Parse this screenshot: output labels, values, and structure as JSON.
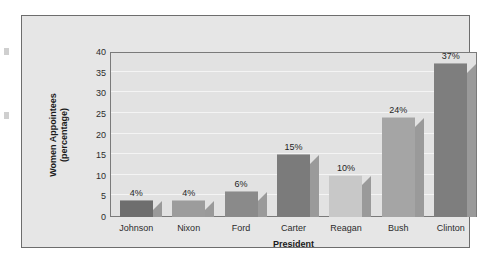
{
  "chart_data": {
    "type": "bar",
    "title": "",
    "subtitle": "",
    "xlabel": "President",
    "ylabel": "Women Appointees (percentage)",
    "ylabel_lines": [
      "Women Appointees",
      "(percentage)"
    ],
    "categories": [
      "Johnson",
      "Nixon",
      "Ford",
      "Carter",
      "Reagan",
      "Bush",
      "Clinton"
    ],
    "values": [
      4,
      4,
      6,
      15,
      10,
      24,
      37
    ],
    "value_labels": [
      "4%",
      "4%",
      "6%",
      "15%",
      "10%",
      "24%",
      "37%"
    ],
    "ylim": [
      0,
      40
    ],
    "ytick_values": [
      0,
      5,
      10,
      15,
      20,
      25,
      30,
      35,
      40
    ],
    "ytick_labels": [
      "0",
      "5",
      "10",
      "15",
      "20",
      "25",
      "30",
      "35",
      "40"
    ],
    "grid": true,
    "grid_orientation": "horizontal",
    "legend": false,
    "legend_position": "none",
    "bar_colors": [
      "#6e6e6e",
      "#9c9c9c",
      "#8a8a8a",
      "#7b7b7b",
      "#c8c8c8",
      "#a5a5a5",
      "#7e7e7e"
    ],
    "plot_background": "#e2e2e2",
    "figure_background": "#e6e6e6",
    "gridline_color": "#f4f4f4",
    "axis_color": "#7a7a7a",
    "bar_shadow_color": "#9a9a9a"
  }
}
